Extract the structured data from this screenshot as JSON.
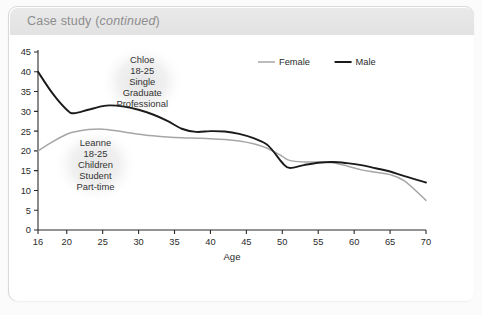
{
  "panel": {
    "header_prefix": "Case study (",
    "header_emphasis": "continued",
    "header_suffix": ")"
  },
  "chart_data": {
    "type": "line",
    "title": "",
    "xlabel": "Age",
    "ylabel": "",
    "xlim": [
      16,
      70
    ],
    "ylim": [
      0,
      45
    ],
    "xticks": [
      16,
      20,
      25,
      30,
      35,
      40,
      45,
      50,
      55,
      60,
      65,
      70
    ],
    "yticks": [
      0,
      5,
      10,
      15,
      20,
      25,
      30,
      35,
      40,
      45
    ],
    "grid": false,
    "legend_position": "top-right",
    "legend": [
      "Female",
      "Male"
    ],
    "x": [
      16,
      18,
      20,
      21,
      23,
      25,
      26,
      28,
      30,
      32,
      34,
      36,
      38,
      40,
      42,
      44,
      46,
      48,
      50,
      51,
      53,
      55,
      57,
      59,
      61,
      63,
      65,
      67,
      70
    ],
    "series": [
      {
        "name": "Female",
        "color": "#a6a6a6",
        "values": [
          20.0,
          22.3,
          24.2,
          24.8,
          25.4,
          25.5,
          25.3,
          24.8,
          24.2,
          23.8,
          23.5,
          23.3,
          23.2,
          23.1,
          22.9,
          22.5,
          21.8,
          20.6,
          18.6,
          17.6,
          17.2,
          17.2,
          17.0,
          16.2,
          15.2,
          14.6,
          14.0,
          12.4,
          7.5
        ]
      },
      {
        "name": "Male",
        "color": "#1b1b1b",
        "values": [
          40.0,
          34.6,
          30.4,
          29.5,
          30.4,
          31.3,
          31.5,
          31.2,
          30.4,
          29.2,
          27.6,
          25.6,
          24.8,
          25.0,
          24.9,
          24.3,
          23.2,
          21.4,
          17.0,
          15.7,
          16.4,
          17.0,
          17.2,
          16.9,
          16.4,
          15.6,
          14.8,
          13.6,
          12.0
        ]
      }
    ],
    "annotations": [
      {
        "name": "Chloe",
        "lines": [
          "Chloe",
          "18-25",
          "Single",
          "Graduate",
          "Professional"
        ],
        "cx": 30.5,
        "cy": 37.5
      },
      {
        "name": "Leanne",
        "lines": [
          "Leanne",
          "18-25",
          "Children",
          "Student",
          "Part-time"
        ],
        "cx": 24.0,
        "cy": 16.5
      }
    ]
  }
}
